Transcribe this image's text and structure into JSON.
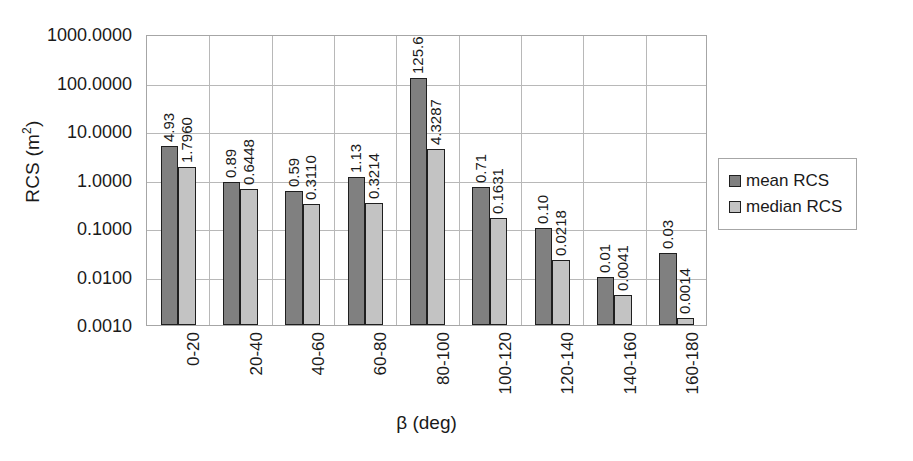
{
  "chart_data": {
    "type": "bar",
    "title": "",
    "xlabel": "β (deg)",
    "ylabel": "RCS (m²)",
    "yscale": "log",
    "ylim": [
      0.001,
      1000
    ],
    "ytick_labels": [
      "1000.0000",
      "100.0000",
      "10.0000",
      "1.0000",
      "0.1000",
      "0.0100",
      "0.0010"
    ],
    "ytick_values": [
      1000,
      100,
      10,
      1,
      0.1,
      0.01,
      0.001
    ],
    "grid": true,
    "legend_position": "right",
    "categories": [
      "0-20",
      "20-40",
      "40-60",
      "60-80",
      "80-100",
      "100-120",
      "120-140",
      "140-160",
      "160-180"
    ],
    "series": [
      {
        "name": "mean RCS",
        "color": "#808080",
        "values": [
          4.93,
          0.89,
          0.59,
          1.13,
          125.6,
          0.71,
          0.1,
          0.01,
          0.03
        ],
        "labels": [
          "4.93",
          "0.89",
          "0.59",
          "1.13",
          "125.6",
          "0.71",
          "0.10",
          "0.01",
          "0.03"
        ]
      },
      {
        "name": "median RCS",
        "color": "#c3c3c3",
        "values": [
          1.796,
          0.6448,
          0.311,
          0.3214,
          4.3287,
          0.1631,
          0.0218,
          0.0041,
          0.0014
        ],
        "labels": [
          "1.7960",
          "0.6448",
          "0.3110",
          "0.3214",
          "4.3287",
          "0.1631",
          "0.0218",
          "0.0041",
          "0.0014"
        ]
      }
    ]
  },
  "legend": {
    "items": [
      {
        "label": "mean RCS"
      },
      {
        "label": "median RCS"
      }
    ]
  },
  "axis_titles": {
    "y_main": "RCS (m",
    "y_sup": "2",
    "y_close": ")",
    "x": "β (deg)"
  }
}
